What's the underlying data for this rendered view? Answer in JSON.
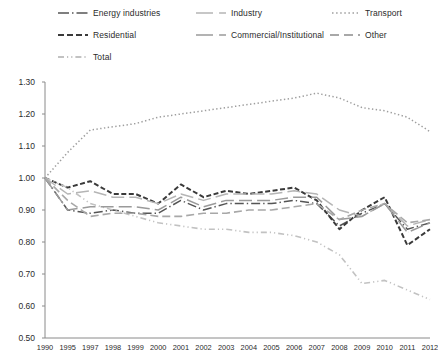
{
  "chart_data": {
    "type": "line",
    "title": "",
    "subtitle": "",
    "xlabel": "",
    "ylabel": "",
    "ylim": [
      0.5,
      1.3
    ],
    "ytick_step": 0.1,
    "yticks": [
      "0.50",
      "0.60",
      "0.70",
      "0.80",
      "0.90",
      "1.00",
      "1.10",
      "1.20",
      "1.30"
    ],
    "grid": false,
    "legend_position": "top",
    "categories": [
      "1990",
      "1995",
      "1997",
      "1998",
      "1999",
      "2000",
      "2001",
      "2002",
      "2003",
      "2004",
      "2005",
      "2006",
      "2007",
      "2008",
      "2009",
      "2010",
      "2011",
      "2012"
    ],
    "series": [
      {
        "name": "Energy industries",
        "style": "long-dash-dot",
        "color": "#555555",
        "values": [
          1.0,
          0.9,
          0.89,
          0.9,
          0.89,
          0.89,
          0.93,
          0.9,
          0.92,
          0.92,
          0.92,
          0.93,
          0.92,
          0.85,
          0.89,
          0.92,
          0.84,
          0.86
        ]
      },
      {
        "name": "Residential",
        "style": "dashed",
        "color": "#3a3a3a",
        "values": [
          1.0,
          0.97,
          0.99,
          0.95,
          0.95,
          0.92,
          0.98,
          0.94,
          0.96,
          0.95,
          0.96,
          0.97,
          0.93,
          0.84,
          0.9,
          0.94,
          0.79,
          0.84
        ]
      },
      {
        "name": "Total",
        "style": "dash-dot-dot",
        "color": "#c2c2c2",
        "values": [
          1.0,
          0.97,
          0.92,
          0.9,
          0.88,
          0.86,
          0.85,
          0.84,
          0.84,
          0.83,
          0.83,
          0.82,
          0.8,
          0.76,
          0.67,
          0.68,
          0.65,
          0.62
        ]
      },
      {
        "name": "Industry",
        "style": "solid",
        "color": "#b5b5b5",
        "values": [
          1.0,
          0.95,
          0.96,
          0.94,
          0.94,
          0.92,
          0.95,
          0.93,
          0.95,
          0.95,
          0.95,
          0.96,
          0.95,
          0.9,
          0.88,
          0.92,
          0.85,
          0.87
        ]
      },
      {
        "name": "Commercial/Institutional",
        "style": "solid-mid",
        "color": "#9a9a9a",
        "values": [
          1.0,
          0.9,
          0.91,
          0.91,
          0.91,
          0.9,
          0.94,
          0.91,
          0.93,
          0.93,
          0.93,
          0.94,
          0.94,
          0.87,
          0.88,
          0.92,
          0.83,
          0.86
        ]
      },
      {
        "name": "Other",
        "style": "long-dash",
        "color": "#a8a8a8",
        "values": [
          1.0,
          0.93,
          0.88,
          0.89,
          0.89,
          0.88,
          0.88,
          0.89,
          0.89,
          0.9,
          0.9,
          0.91,
          0.92,
          0.87,
          0.9,
          0.92,
          0.86,
          0.87
        ]
      },
      {
        "name": "Transport",
        "style": "dotted",
        "color": "#9e9e9e",
        "values": [
          1.0,
          1.08,
          1.15,
          1.16,
          1.17,
          1.19,
          1.2,
          1.21,
          1.22,
          1.23,
          1.24,
          1.25,
          1.265,
          1.25,
          1.22,
          1.21,
          1.19,
          1.145
        ]
      }
    ]
  },
  "legend": {
    "items": [
      {
        "label": "Energy industries",
        "icon": "line-swatch-long-dash-dot"
      },
      {
        "label": "Industry",
        "icon": "line-swatch-solid"
      },
      {
        "label": "Transport",
        "icon": "line-swatch-dotted"
      },
      {
        "label": "Residential",
        "icon": "line-swatch-dashed"
      },
      {
        "label": "Commercial/Institutional",
        "icon": "line-swatch-solid-mid"
      },
      {
        "label": "Other",
        "icon": "line-swatch-long-dash"
      },
      {
        "label": "Total",
        "icon": "line-swatch-dash-dot-dot"
      }
    ]
  }
}
